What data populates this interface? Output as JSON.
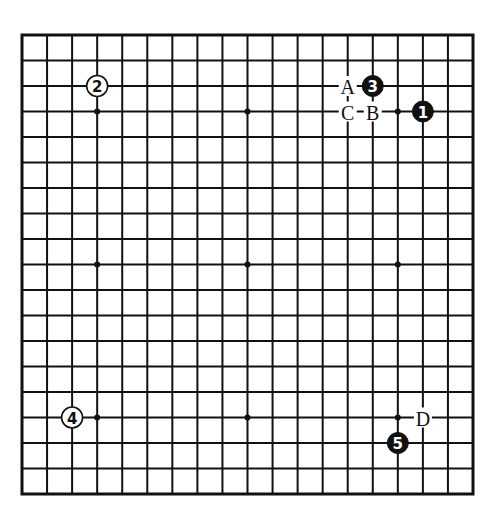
{
  "diagram": {
    "type": "go-board",
    "size": 19,
    "colors": {
      "line": "#111111",
      "black_stone": "#111111",
      "white_stone": "#ffffff",
      "background": "#ffffff"
    },
    "star_points": [
      [
        3,
        3
      ],
      [
        9,
        3
      ],
      [
        15,
        3
      ],
      [
        3,
        9
      ],
      [
        9,
        9
      ],
      [
        15,
        9
      ],
      [
        3,
        15
      ],
      [
        9,
        15
      ],
      [
        15,
        15
      ]
    ],
    "stones": [
      {
        "move": "1",
        "color": "black",
        "col": 16,
        "row": 3
      },
      {
        "move": "2",
        "color": "white",
        "col": 3,
        "row": 2
      },
      {
        "move": "3",
        "color": "black",
        "col": 14,
        "row": 2
      },
      {
        "move": "4",
        "color": "white",
        "col": 2,
        "row": 15
      },
      {
        "move": "5",
        "color": "black",
        "col": 15,
        "row": 16
      }
    ],
    "labels": [
      {
        "text": "A",
        "col": 13,
        "row": 2
      },
      {
        "text": "B",
        "col": 14,
        "row": 3
      },
      {
        "text": "C",
        "col": 13,
        "row": 3
      },
      {
        "text": "D",
        "col": 16,
        "row": 15
      }
    ]
  }
}
